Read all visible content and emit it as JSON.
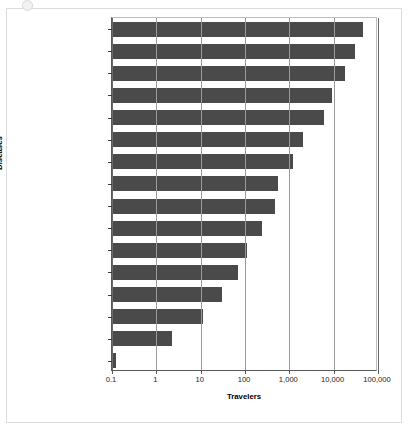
{
  "chart_data": {
    "type": "bar",
    "orientation": "horizontal",
    "title": "",
    "xlabel": "Travelers",
    "ylabel": "Diseases",
    "xscale": "log",
    "xlim": [
      0.1,
      100000
    ],
    "xticks": [
      0.1,
      1,
      10,
      100,
      1000,
      10000,
      100000
    ],
    "xtick_labels": [
      "0.1",
      "1",
      "10",
      "100",
      "1,000",
      "10,000",
      "100,000"
    ],
    "grid": "vertical",
    "legend": "none",
    "bar_color": "#4a4a4a",
    "categories": [
      "Any health problem",
      "Travelers' diarrhea",
      "Felt ill",
      "Consulted doctor",
      "Stayed in bed",
      "Malaria (West Africa)",
      "Fever/acute URI",
      "Hospitalized abroad",
      "Hepatitis A",
      "Gonorrhea",
      "Hepatitis B",
      "Air evacuation",
      "Typhoid",
      "HIV",
      "Poliomyelitis",
      "Cholera"
    ],
    "values": [
      45000,
      30000,
      18000,
      9000,
      6000,
      2000,
      1200,
      560,
      480,
      240,
      110,
      70,
      30,
      11,
      2.2,
      0.12
    ]
  }
}
